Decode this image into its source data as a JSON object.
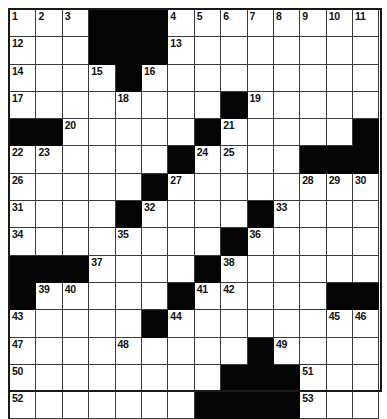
{
  "puzzle": {
    "title": "Crossword Grid",
    "columns": 14,
    "rows": 14,
    "cell_colors": {
      "white": "#ffffff",
      "block": "#050505",
      "grid_line": "#3a3a3a",
      "border": "#1a1a1a",
      "number_text": "#111111"
    },
    "grid": [
      [
        {
          "t": "w",
          "n": "1"
        },
        {
          "t": "w",
          "n": "2"
        },
        {
          "t": "w",
          "n": "3"
        },
        {
          "t": "b",
          "n": ""
        },
        {
          "t": "b",
          "n": ""
        },
        {
          "t": "b",
          "n": ""
        },
        {
          "t": "w",
          "n": "4"
        },
        {
          "t": "w",
          "n": "5"
        },
        {
          "t": "w",
          "n": "6"
        },
        {
          "t": "w",
          "n": "7"
        },
        {
          "t": "w",
          "n": "8"
        },
        {
          "t": "w",
          "n": "9"
        },
        {
          "t": "w",
          "n": "10"
        },
        {
          "t": "w",
          "n": "11"
        }
      ],
      [
        {
          "t": "w",
          "n": "12"
        },
        {
          "t": "w",
          "n": ""
        },
        {
          "t": "w",
          "n": ""
        },
        {
          "t": "b",
          "n": ""
        },
        {
          "t": "b",
          "n": ""
        },
        {
          "t": "b",
          "n": ""
        },
        {
          "t": "w",
          "n": "13"
        },
        {
          "t": "w",
          "n": ""
        },
        {
          "t": "w",
          "n": ""
        },
        {
          "t": "w",
          "n": ""
        },
        {
          "t": "w",
          "n": ""
        },
        {
          "t": "w",
          "n": ""
        },
        {
          "t": "w",
          "n": ""
        },
        {
          "t": "w",
          "n": ""
        }
      ],
      [
        {
          "t": "w",
          "n": "14"
        },
        {
          "t": "w",
          "n": ""
        },
        {
          "t": "w",
          "n": ""
        },
        {
          "t": "w",
          "n": "15"
        },
        {
          "t": "b",
          "n": ""
        },
        {
          "t": "w",
          "n": "16"
        },
        {
          "t": "w",
          "n": ""
        },
        {
          "t": "w",
          "n": ""
        },
        {
          "t": "w",
          "n": ""
        },
        {
          "t": "w",
          "n": ""
        },
        {
          "t": "w",
          "n": ""
        },
        {
          "t": "w",
          "n": ""
        },
        {
          "t": "w",
          "n": ""
        },
        {
          "t": "w",
          "n": ""
        }
      ],
      [
        {
          "t": "w",
          "n": "17"
        },
        {
          "t": "w",
          "n": ""
        },
        {
          "t": "w",
          "n": ""
        },
        {
          "t": "w",
          "n": ""
        },
        {
          "t": "w",
          "n": "18"
        },
        {
          "t": "w",
          "n": ""
        },
        {
          "t": "w",
          "n": ""
        },
        {
          "t": "w",
          "n": ""
        },
        {
          "t": "b",
          "n": ""
        },
        {
          "t": "w",
          "n": "19"
        },
        {
          "t": "w",
          "n": ""
        },
        {
          "t": "w",
          "n": ""
        },
        {
          "t": "w",
          "n": ""
        },
        {
          "t": "w",
          "n": ""
        }
      ],
      [
        {
          "t": "b",
          "n": ""
        },
        {
          "t": "b",
          "n": ""
        },
        {
          "t": "w",
          "n": "20"
        },
        {
          "t": "w",
          "n": ""
        },
        {
          "t": "w",
          "n": ""
        },
        {
          "t": "w",
          "n": ""
        },
        {
          "t": "w",
          "n": ""
        },
        {
          "t": "b",
          "n": ""
        },
        {
          "t": "w",
          "n": "21"
        },
        {
          "t": "w",
          "n": ""
        },
        {
          "t": "w",
          "n": ""
        },
        {
          "t": "w",
          "n": ""
        },
        {
          "t": "w",
          "n": ""
        },
        {
          "t": "b",
          "n": ""
        }
      ],
      [
        {
          "t": "w",
          "n": "22"
        },
        {
          "t": "w",
          "n": "23"
        },
        {
          "t": "w",
          "n": ""
        },
        {
          "t": "w",
          "n": ""
        },
        {
          "t": "w",
          "n": ""
        },
        {
          "t": "w",
          "n": ""
        },
        {
          "t": "b",
          "n": ""
        },
        {
          "t": "w",
          "n": "24"
        },
        {
          "t": "w",
          "n": "25"
        },
        {
          "t": "w",
          "n": ""
        },
        {
          "t": "w",
          "n": ""
        },
        {
          "t": "b",
          "n": ""
        },
        {
          "t": "b",
          "n": ""
        },
        {
          "t": "b",
          "n": ""
        }
      ],
      [
        {
          "t": "w",
          "n": "26"
        },
        {
          "t": "w",
          "n": ""
        },
        {
          "t": "w",
          "n": ""
        },
        {
          "t": "w",
          "n": ""
        },
        {
          "t": "w",
          "n": ""
        },
        {
          "t": "b",
          "n": ""
        },
        {
          "t": "w",
          "n": "27"
        },
        {
          "t": "w",
          "n": ""
        },
        {
          "t": "w",
          "n": ""
        },
        {
          "t": "w",
          "n": ""
        },
        {
          "t": "w",
          "n": ""
        },
        {
          "t": "w",
          "n": "28"
        },
        {
          "t": "w",
          "n": "29"
        },
        {
          "t": "w",
          "n": "30"
        }
      ],
      [
        {
          "t": "w",
          "n": "31"
        },
        {
          "t": "w",
          "n": ""
        },
        {
          "t": "w",
          "n": ""
        },
        {
          "t": "w",
          "n": ""
        },
        {
          "t": "b",
          "n": ""
        },
        {
          "t": "w",
          "n": "32"
        },
        {
          "t": "w",
          "n": ""
        },
        {
          "t": "w",
          "n": ""
        },
        {
          "t": "w",
          "n": ""
        },
        {
          "t": "b",
          "n": ""
        },
        {
          "t": "w",
          "n": "33"
        },
        {
          "t": "w",
          "n": ""
        },
        {
          "t": "w",
          "n": ""
        },
        {
          "t": "w",
          "n": ""
        }
      ],
      [
        {
          "t": "w",
          "n": "34"
        },
        {
          "t": "w",
          "n": ""
        },
        {
          "t": "w",
          "n": ""
        },
        {
          "t": "w",
          "n": ""
        },
        {
          "t": "w",
          "n": "35"
        },
        {
          "t": "w",
          "n": ""
        },
        {
          "t": "w",
          "n": ""
        },
        {
          "t": "w",
          "n": ""
        },
        {
          "t": "b",
          "n": ""
        },
        {
          "t": "w",
          "n": "36"
        },
        {
          "t": "w",
          "n": ""
        },
        {
          "t": "w",
          "n": ""
        },
        {
          "t": "w",
          "n": ""
        },
        {
          "t": "w",
          "n": ""
        }
      ],
      [
        {
          "t": "b",
          "n": ""
        },
        {
          "t": "b",
          "n": ""
        },
        {
          "t": "b",
          "n": ""
        },
        {
          "t": "w",
          "n": "37"
        },
        {
          "t": "w",
          "n": ""
        },
        {
          "t": "w",
          "n": ""
        },
        {
          "t": "w",
          "n": ""
        },
        {
          "t": "b",
          "n": ""
        },
        {
          "t": "w",
          "n": "38"
        },
        {
          "t": "w",
          "n": ""
        },
        {
          "t": "w",
          "n": ""
        },
        {
          "t": "w",
          "n": ""
        },
        {
          "t": "w",
          "n": ""
        },
        {
          "t": "w",
          "n": ""
        }
      ],
      [
        {
          "t": "b",
          "n": ""
        },
        {
          "t": "w",
          "n": "39"
        },
        {
          "t": "w",
          "n": "40"
        },
        {
          "t": "w",
          "n": ""
        },
        {
          "t": "w",
          "n": ""
        },
        {
          "t": "w",
          "n": ""
        },
        {
          "t": "b",
          "n": ""
        },
        {
          "t": "w",
          "n": "41"
        },
        {
          "t": "w",
          "n": "42"
        },
        {
          "t": "w",
          "n": ""
        },
        {
          "t": "w",
          "n": ""
        },
        {
          "t": "w",
          "n": ""
        },
        {
          "t": "b",
          "n": ""
        },
        {
          "t": "b",
          "n": ""
        }
      ],
      [
        {
          "t": "w",
          "n": "43"
        },
        {
          "t": "w",
          "n": ""
        },
        {
          "t": "w",
          "n": ""
        },
        {
          "t": "w",
          "n": ""
        },
        {
          "t": "w",
          "n": ""
        },
        {
          "t": "b",
          "n": ""
        },
        {
          "t": "w",
          "n": "44"
        },
        {
          "t": "w",
          "n": ""
        },
        {
          "t": "w",
          "n": ""
        },
        {
          "t": "w",
          "n": ""
        },
        {
          "t": "w",
          "n": ""
        },
        {
          "t": "w",
          "n": ""
        },
        {
          "t": "w",
          "n": "45"
        },
        {
          "t": "w",
          "n": "46"
        }
      ],
      [
        {
          "t": "w",
          "n": "47"
        },
        {
          "t": "w",
          "n": ""
        },
        {
          "t": "w",
          "n": ""
        },
        {
          "t": "w",
          "n": ""
        },
        {
          "t": "w",
          "n": "48"
        },
        {
          "t": "w",
          "n": ""
        },
        {
          "t": "w",
          "n": ""
        },
        {
          "t": "w",
          "n": ""
        },
        {
          "t": "w",
          "n": ""
        },
        {
          "t": "b",
          "n": ""
        },
        {
          "t": "w",
          "n": "49"
        },
        {
          "t": "w",
          "n": ""
        },
        {
          "t": "w",
          "n": ""
        },
        {
          "t": "w",
          "n": ""
        }
      ],
      [
        {
          "t": "w",
          "n": "50"
        },
        {
          "t": "w",
          "n": ""
        },
        {
          "t": "w",
          "n": ""
        },
        {
          "t": "w",
          "n": ""
        },
        {
          "t": "w",
          "n": ""
        },
        {
          "t": "w",
          "n": ""
        },
        {
          "t": "w",
          "n": ""
        },
        {
          "t": "w",
          "n": ""
        },
        {
          "t": "b",
          "n": ""
        },
        {
          "t": "b",
          "n": ""
        },
        {
          "t": "b",
          "n": ""
        },
        {
          "t": "w",
          "n": "51"
        },
        {
          "t": "w",
          "n": ""
        },
        {
          "t": "w",
          "n": ""
        }
      ],
      [
        {
          "t": "w",
          "n": "52"
        },
        {
          "t": "w",
          "n": ""
        },
        {
          "t": "w",
          "n": ""
        },
        {
          "t": "w",
          "n": ""
        },
        {
          "t": "w",
          "n": ""
        },
        {
          "t": "w",
          "n": ""
        },
        {
          "t": "w",
          "n": ""
        },
        {
          "t": "b",
          "n": ""
        },
        {
          "t": "b",
          "n": ""
        },
        {
          "t": "b",
          "n": ""
        },
        {
          "t": "b",
          "n": ""
        },
        {
          "t": "w",
          "n": "53"
        },
        {
          "t": "w",
          "n": ""
        },
        {
          "t": "w",
          "n": ""
        }
      ]
    ]
  }
}
